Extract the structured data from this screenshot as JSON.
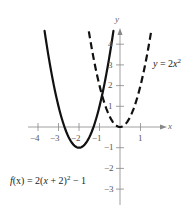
{
  "chart_data": {
    "type": "line",
    "title": "",
    "xlabel": "x",
    "ylabel": "y",
    "xlim": [
      -4.4,
      2.2
    ],
    "ylim": [
      -3.8,
      4.6
    ],
    "grid": false,
    "x_ticks": [
      -4,
      -3,
      -2,
      -1,
      1
    ],
    "x_tick_labels": [
      "−4",
      "−3",
      "−2",
      "−1",
      "1"
    ],
    "y_ticks": [
      -3,
      -2,
      -1,
      1,
      2,
      3,
      4
    ],
    "y_tick_labels": [
      "−3",
      "−2",
      "−1",
      "1",
      "2",
      "3",
      "4"
    ],
    "series": [
      {
        "name": "f(x) = 2(x + 2)^2 − 1",
        "style": "solid",
        "color": "#111111",
        "equation": {
          "a": 2,
          "h": -2,
          "k": -1
        },
        "vertex": [
          -2,
          -1
        ],
        "x_range": [
          -3.68,
          -0.32
        ]
      },
      {
        "name": "y = 2x^2",
        "style": "dashed",
        "color": "#111111",
        "equation": {
          "a": 2,
          "h": 0,
          "k": 0
        },
        "vertex": [
          0,
          0
        ],
        "x_range": [
          -1.52,
          1.52
        ]
      }
    ],
    "annotations": [
      {
        "text": "y = 2x²",
        "near_series": "y = 2x^2",
        "position": "right"
      },
      {
        "text": "f(x) = 2(x + 2)² − 1",
        "near_series": "f(x) = 2(x + 2)^2 − 1",
        "position": "lower-left"
      }
    ]
  },
  "labels": {
    "x_axis": "x",
    "y_axis": "y",
    "x_ticks": [
      "−4",
      "−3",
      "−2",
      "−1",
      "1"
    ],
    "y_ticks": [
      "4",
      "3",
      "2",
      "1",
      "−1",
      "−2",
      "−3"
    ],
    "eq_dashed": {
      "lhs": "y",
      "eq": " = 2",
      "var": "x",
      "exp": "2"
    },
    "eq_solid": {
      "lhs": "f",
      "arg": "(x)",
      "eq": " = 2(",
      "var": "x",
      "mid": " + 2)",
      "exp": "2",
      "tail": " − 1"
    }
  }
}
